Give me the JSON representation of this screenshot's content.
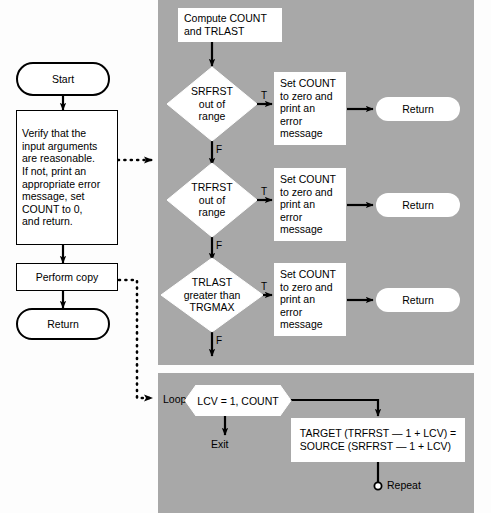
{
  "diagram": {
    "colors": {
      "panel_gray": "#a8a8a8",
      "node_fill": "#ffffff",
      "stroke": "#000000",
      "page_bg": "#fdfdfd"
    }
  },
  "left_column": {
    "start": {
      "label": "Start",
      "shape": "stadium"
    },
    "verify": {
      "label": "Verify that the\ninput arguments\nare reasonable.\nIf not, print an\nappropriate error\nmessage, set\nCOUNT to 0,\nand return.",
      "shape": "process"
    },
    "perform_copy": {
      "label": "Perform copy",
      "shape": "process"
    },
    "return": {
      "label": "Return",
      "shape": "stadium"
    }
  },
  "detail_panel": {
    "compute": {
      "label": "Compute COUNT\nand TRLAST",
      "shape": "process"
    },
    "decisions": [
      {
        "id": "srfrst",
        "label": "SRFRST\nout of\nrange",
        "true_label": "T",
        "false_label": "F"
      },
      {
        "id": "trfrst",
        "label": "TRFRST\nout of\nrange",
        "true_label": "T",
        "false_label": "F"
      },
      {
        "id": "trlast",
        "label": "TRLAST\ngreater than\nTRGMAX",
        "true_label": "T",
        "false_label": "F"
      }
    ],
    "error_actions": [
      {
        "label": "Set COUNT\nto zero and\nprint an\nerror\nmessage"
      },
      {
        "label": "Set COUNT\nto zero and\nprint an\nerror\nmessage"
      },
      {
        "label": "Set COUNT\nto zero and\nprint an\nerror\nmessage"
      }
    ],
    "returns": [
      {
        "label": "Return"
      },
      {
        "label": "Return"
      },
      {
        "label": "Return"
      }
    ]
  },
  "loop_panel": {
    "loop_keyword": "Loop",
    "loop_header": "LCV = 1, COUNT",
    "exit_label": "Exit",
    "body": "TARGET (TRFRST — 1 + LCV) =\nSOURCE (SRFRST — 1 + LCV)",
    "repeat_label": "Repeat"
  }
}
